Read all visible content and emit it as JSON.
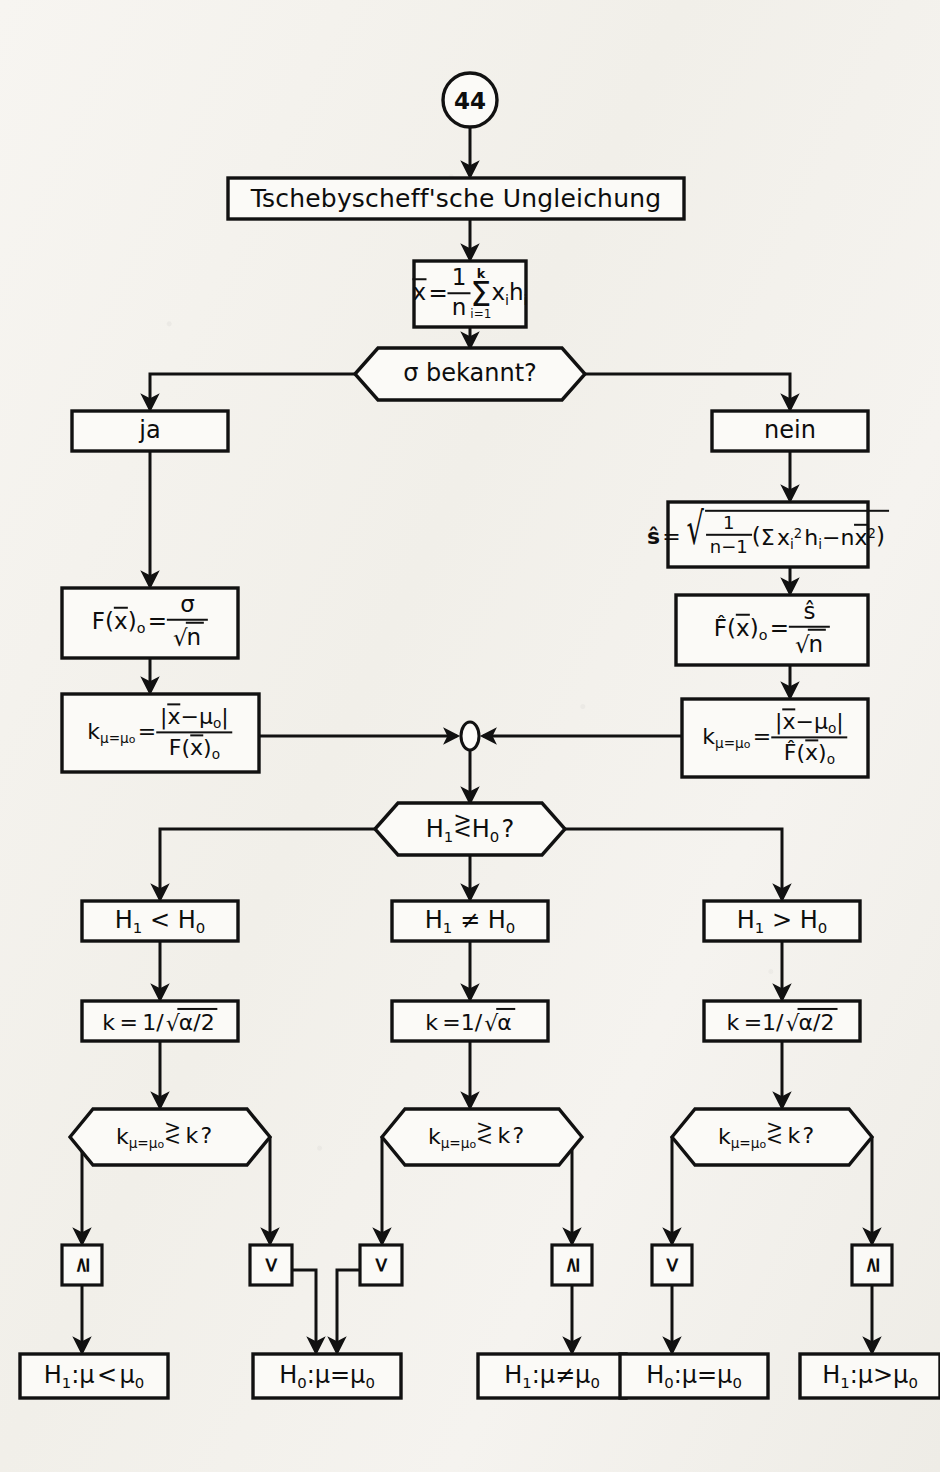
{
  "document": {
    "kind": "flowchart",
    "language": "de",
    "page_marker": "44",
    "title": "Tschebyscheff'sche Ungleichung"
  },
  "nodes": {
    "start_circle": "44",
    "title_box": "Tschebyscheff'sche Ungleichung",
    "mean_formula": "x̄ = 1/n Σ(i=1..k) xᵢ hᵢ",
    "sigma_decision": "σ bekannt?",
    "branch_yes": "ja",
    "branch_no": "nein",
    "s_hat_formula": "ŝ = √( 1/(n−1) ( Σ xᵢ² hᵢ − n x̄² ) )",
    "f_left": "F(x̄)ₒ = σ / √n",
    "f_right": "F̂(x̄)ₒ = ŝ / √n",
    "k_left": "k(μ=μₒ) = |x̄ − μₒ| / F(x̄)ₒ",
    "k_right": "k(μ=μₒ) = |x̄ − μₒ| / F̂(x̄)ₒ",
    "hypothesis_decision": "H₁ ≷ H₀ ?",
    "hyp_less": "H₁ < H₀",
    "hyp_noteq": "H₁ ≠ H₀",
    "hyp_greater": "H₁ > H₀",
    "k_crit_left": "k = 1/√(α/2)",
    "k_crit_mid": "k = 1/√α",
    "k_crit_right": "k = 1/√(α/2)",
    "compare_left": "k(μ=μₒ) ≷ k ?",
    "compare_mid": "k(μ=μₒ) ≷ k ?",
    "compare_right": "k(μ=μₒ) ≷ k ?",
    "result_1": "H₁ : μ < μ₀",
    "result_2": "H₀ : μ = μ₀",
    "result_3": "H₁ : μ ≠ μ₀",
    "result_4": "H₀ : μ = μ₀",
    "result_5": "H₁ : μ > μ₀"
  },
  "labels": {
    "sigma": "σ",
    "ja": "ja",
    "nein": "nein",
    "page": "44",
    "title": "Tschebyscheff'sche Ungleichung",
    "question_sigma": "σ bekannt?",
    "k_letter": "k",
    "question_mark": "?",
    "alpha": "α",
    "alpha_half": "α/2",
    "n": "n",
    "n_minus_1": "n−1",
    "one": "1",
    "sum": "Σ",
    "sum_upper": "k",
    "sum_lower": "i=1",
    "branch_ge": "≥",
    "branch_lt": "<",
    "h1": "H",
    "sub1": "1",
    "sub0": "0",
    "lt": "<",
    "gt": ">",
    "neq": "≠",
    "eq": "=",
    "mu": "μ",
    "mu0": "μ",
    "colon": ":",
    "equals": "=",
    "s_hat": "ŝ",
    "x_bar": "x̄",
    "F": "F",
    "F_hat": "F̂",
    "sub_o": "o",
    "sub_i": "i",
    "sup_2": "2",
    "x": "x",
    "h": "h"
  },
  "small_decisions": [
    {
      "id": "sd-1",
      "symbol": "≥"
    },
    {
      "id": "sd-2",
      "symbol": "<"
    },
    {
      "id": "sd-3",
      "symbol": "<"
    },
    {
      "id": "sd-4",
      "symbol": "≥"
    },
    {
      "id": "sd-5",
      "symbol": "<"
    },
    {
      "id": "sd-6",
      "symbol": "≥"
    }
  ],
  "results": [
    {
      "id": "res-1",
      "h": "H",
      "hsub": "1",
      "rel": "<"
    },
    {
      "id": "res-2",
      "h": "H",
      "hsub": "0",
      "rel": "="
    },
    {
      "id": "res-3",
      "h": "H",
      "hsub": "1",
      "rel": "≠"
    },
    {
      "id": "res-4",
      "h": "H",
      "hsub": "0",
      "rel": "="
    },
    {
      "id": "res-5",
      "h": "H",
      "hsub": "1",
      "rel": ">"
    }
  ],
  "hypothesis_boxes": [
    {
      "id": "hyp-left",
      "rel": "<"
    },
    {
      "id": "hyp-mid",
      "rel": "≠"
    },
    {
      "id": "hyp-right",
      "rel": ">"
    }
  ],
  "k_crit_boxes": [
    {
      "id": "kc-left",
      "radicand": "α/2"
    },
    {
      "id": "kc-mid",
      "radicand": "α"
    },
    {
      "id": "kc-right",
      "radicand": "α/2"
    }
  ],
  "colors": {
    "ink": "#111111",
    "paper": "#f4f2ee",
    "node_fill": "#fbfaf7"
  }
}
